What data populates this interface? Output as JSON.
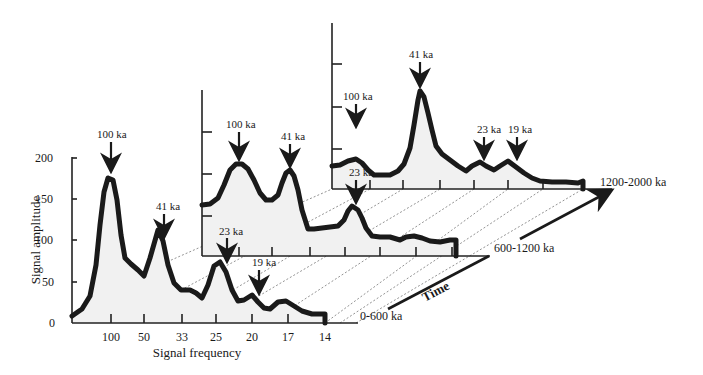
{
  "chart_data": {
    "type": "area",
    "title": "",
    "xlabel": "Signal frequency",
    "ylabel": "Signal amplitude",
    "depth_axis_label": "Time",
    "ylim": [
      0,
      200
    ],
    "y_ticks": [
      "0",
      "50",
      "100",
      "150",
      "200"
    ],
    "x_tick_labels": [
      "100",
      "50",
      "33",
      "25",
      "20",
      "17",
      "14"
    ],
    "grid": false,
    "legend": null,
    "panels": [
      {
        "name": "0-600 ka",
        "peaks": [
          {
            "label": "100 ka",
            "amplitude": 177
          },
          {
            "label": "41 ka",
            "amplitude": 101
          },
          {
            "label": "23 ka",
            "amplitude": 74
          },
          {
            "label": "19 ka",
            "amplitude": 34
          }
        ]
      },
      {
        "name": "600-1200 ka",
        "peaks": [
          {
            "label": "100 ka",
            "amplitude": 130
          },
          {
            "label": "41 ka",
            "amplitude": 115
          },
          {
            "label": "23 ka",
            "amplitude": 57
          }
        ]
      },
      {
        "name": "1200-2000 ka",
        "peaks": [
          {
            "label": "100 ka",
            "amplitude": 75
          },
          {
            "label": "41 ka",
            "amplitude": 121
          },
          {
            "label": "23 ka",
            "amplitude": 25
          },
          {
            "label": "19 ka",
            "amplitude": 25
          }
        ]
      }
    ]
  },
  "colors": {
    "curve": "#1a1a1a",
    "fill": "#f1f1f1",
    "axis": "#222222",
    "guide": "#777777"
  },
  "labels": {
    "ylabel": "Signal amplitude",
    "xlabel": "Signal frequency",
    "time": "Time",
    "panel_front": "0-600 ka",
    "panel_middle": "600-1200 ka",
    "panel_back": "1200-2000 ka",
    "y0": "0",
    "y50": "50",
    "y100": "100",
    "y150": "150",
    "y200": "200",
    "x100": "100",
    "x50": "50",
    "x33": "33",
    "x25": "25",
    "x20": "20",
    "x17": "17",
    "x14": "14",
    "f_100ka": "100 ka",
    "f_41ka": "41 ka",
    "f_23ka": "23 ka",
    "f_19ka": "19 ka",
    "m_100ka": "100 ka",
    "m_41ka": "41 ka",
    "m_23ka": "23 ka",
    "b_100ka": "100 ka",
    "b_41ka": "41 ka",
    "b_23ka": "23 ka",
    "b_19ka": "19 ka"
  },
  "geometry": {
    "back_curve": "332,166 340,165 348,161 356,159 362,163 368,170 374,175 382,175 390,175 398,171 404,164 410,148 414,125 418,100 420,91 424,97 428,113 432,130 436,146 442,154 450,160 458,166 466,171 472,166 480,162 486,166 494,170 500,166 508,161 516,167 524,173 532,178 540,181 552,182 566,182 578,183 583,181 583,189",
    "middle_curve": "202,205 210,204 218,198 224,185 230,170 236,164 242,164 248,169 254,180 260,193 266,200 272,200 278,195 282,183 286,173 290,170 294,176 298,190 302,210 308,229 314,229 322,228 330,227 338,226 344,220 348,211 352,206 358,210 362,218 366,228 372,236 380,237 390,237 400,240 406,237 414,236 422,238 430,241 440,242 450,240 456,240 456,256",
    "front_curve": "72,316 82,309 90,296 96,265 100,225 104,192 108,178 113,180 117,200 121,235 125,258 131,264 138,270 144,276 150,258 158,230 163,241 168,265 174,283 181,290 190,290 196,293 202,298 208,285 214,266 220,262 226,272 232,290 238,301 244,300 252,295 258,302 264,308 270,309 278,302 286,301 294,306 302,311 312,314 322,314 325,314 325,323"
  }
}
